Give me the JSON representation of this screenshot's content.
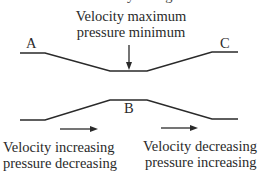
{
  "diagram": {
    "top_partial_label": "Velocity change",
    "annotation_top_line1": "Velocity maximum",
    "annotation_top_line2": "pressure minimum",
    "label_a": "A",
    "label_b": "B",
    "label_c": "C",
    "annotation_left_line1": "Velocity increasing",
    "annotation_left_line2": "pressure decreasing",
    "annotation_right_line1": "Velocity decreasing",
    "annotation_right_line2": "pressure increasing",
    "line_color": "#2a2a2a",
    "upper_wall_points": [
      [
        20,
        53
      ],
      [
        45,
        53
      ],
      [
        110,
        71
      ],
      [
        147,
        71
      ],
      [
        212,
        52
      ],
      [
        238,
        52
      ]
    ],
    "lower_wall_points": [
      [
        20,
        120
      ],
      [
        45,
        120
      ],
      [
        110,
        100
      ],
      [
        147,
        100
      ],
      [
        212,
        119
      ],
      [
        238,
        119
      ]
    ],
    "arrows": [
      {
        "name": "down-arrow",
        "from": [
          129,
          45
        ],
        "to": [
          129,
          69
        ]
      },
      {
        "name": "left-flow-arrow",
        "from": [
          60,
          129
        ],
        "to": [
          97,
          129
        ]
      },
      {
        "name": "right-flow-arrow",
        "from": [
          161,
          128
        ],
        "to": [
          197,
          128
        ]
      }
    ]
  }
}
